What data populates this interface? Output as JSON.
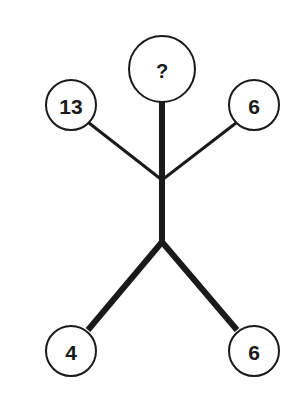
{
  "puzzle": {
    "type": "number-tree",
    "nodes": {
      "top": {
        "label": "?",
        "cx": 162,
        "cy": 69,
        "r": 33
      },
      "upper_left": {
        "label": "13",
        "cx": 71,
        "cy": 105,
        "r": 25
      },
      "upper_right": {
        "label": "6",
        "cx": 254,
        "cy": 105,
        "r": 25
      },
      "lower_left": {
        "label": "4",
        "cx": 71,
        "cy": 351,
        "r": 25
      },
      "lower_right": {
        "label": "6",
        "cx": 254,
        "cy": 351,
        "r": 25
      }
    },
    "junctions": {
      "upper": {
        "x": 162,
        "y": 180
      },
      "lower": {
        "x": 162,
        "y": 242
      }
    },
    "colors": {
      "stroke": "#1a1a1a",
      "background": "#ffffff"
    }
  }
}
